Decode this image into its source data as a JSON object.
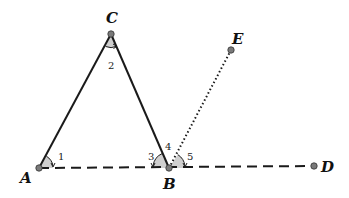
{
  "diagram": {
    "type": "geometry",
    "colors": {
      "line": "#1a1a1a",
      "point": "#7a7a7a",
      "angle_fill": "#cfcfcf"
    },
    "points": {
      "A": {
        "label": "A",
        "x": 39,
        "y": 168
      },
      "B": {
        "label": "B",
        "x": 169,
        "y": 168
      },
      "C": {
        "label": "C",
        "x": 111,
        "y": 34
      },
      "D": {
        "label": "D",
        "x": 314,
        "y": 166
      },
      "E": {
        "label": "E",
        "x": 231,
        "y": 50
      }
    },
    "segments": [
      {
        "from": "A",
        "to": "C",
        "style": "solid"
      },
      {
        "from": "C",
        "to": "B",
        "style": "solid"
      },
      {
        "from": "A",
        "to": "D",
        "style": "dashed"
      },
      {
        "from": "B",
        "to": "E",
        "style": "dotted"
      }
    ],
    "angles": [
      {
        "label": "1",
        "vertex": "A"
      },
      {
        "label": "2",
        "vertex": "C"
      },
      {
        "label": "3",
        "vertex": "B"
      },
      {
        "label": "4",
        "vertex": "B"
      },
      {
        "label": "5",
        "vertex": "B"
      }
    ]
  }
}
